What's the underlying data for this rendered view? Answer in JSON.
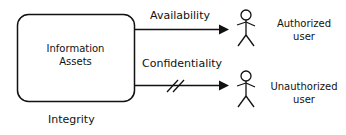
{
  "diagram": {
    "asset_box": {
      "label_line1": "Information",
      "label_line2": "Assets"
    },
    "integrity_label": "Integrity",
    "edges": [
      {
        "label": "Availability",
        "from": "Information Assets",
        "to": "Authorized user",
        "blocked": false
      },
      {
        "label": "Confidentiality",
        "from": "Information Assets",
        "to": "Unauthorized user",
        "blocked": true
      }
    ],
    "actors": [
      {
        "label_line1": "Authorized",
        "label_line2": "user",
        "icon": "stick-figure-icon"
      },
      {
        "label_line1": "Unauthorized",
        "label_line2": "user",
        "icon": "stick-figure-icon"
      }
    ],
    "colors": {
      "stroke": "#111111",
      "background": "#ffffff"
    }
  }
}
